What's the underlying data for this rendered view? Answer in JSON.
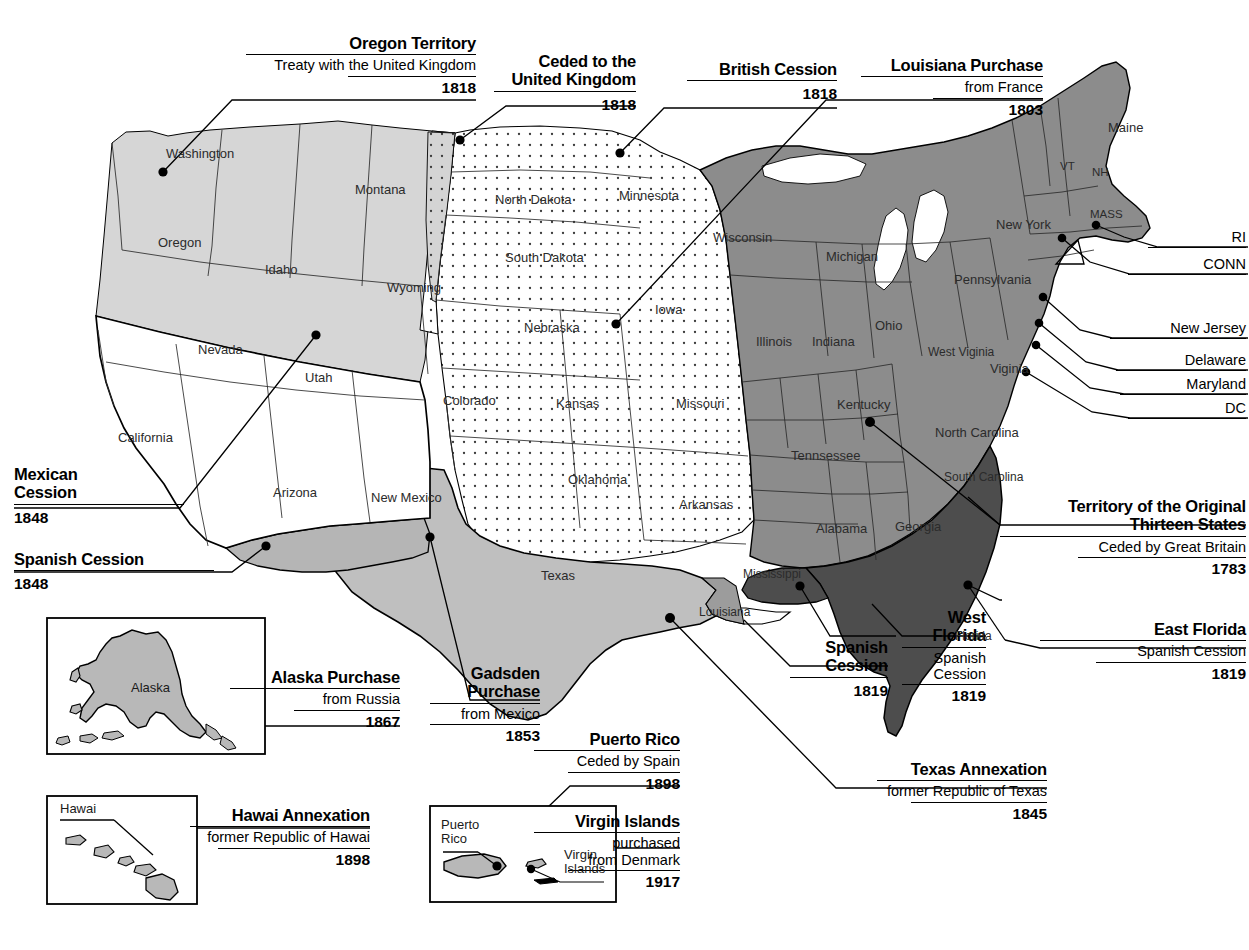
{
  "map": {
    "title": "United States territorial acquisitions",
    "colors": {
      "original_thirteen": "#8c8c8c",
      "florida_cession": "#4d4d4d",
      "oregon_territory": "#d4d4d4",
      "texas_annexation": "#bdbdbd",
      "gadsden_purchase": "#b3b3b3",
      "louisiana_purchase_stipple": "#ffffff",
      "mexican_cession": "#ffffff",
      "outline": "#000000"
    }
  },
  "callouts": [
    {
      "id": "oregon-territory",
      "title": "Oregon Territory",
      "sub": "Treaty with the United Kingdom",
      "year": "1818"
    },
    {
      "id": "ceded-uk",
      "title": "Ceded to the\nUnited Kingdom",
      "sub": "",
      "year": "1818"
    },
    {
      "id": "british-cession",
      "title": "British Cession",
      "sub": "",
      "year": "1818"
    },
    {
      "id": "louisiana-purchase",
      "title": "Louisiana Purchase",
      "sub": "from France",
      "year": "1803"
    },
    {
      "id": "thirteen-states",
      "title": "Territory of the Original\nThirteen States",
      "sub": "Ceded by Great Britain",
      "year": "1783"
    },
    {
      "id": "east-florida",
      "title": "East Florida",
      "sub": "Spanish Cession",
      "year": "1819"
    },
    {
      "id": "west-florida",
      "title": "West\nFlorida",
      "sub": "Spanish\nCession",
      "year": "1819"
    },
    {
      "id": "spanish-cession-gulf",
      "title": "Spanish\nCession",
      "sub": "",
      "year": "1819"
    },
    {
      "id": "mexican-cession",
      "title": "Mexican\nCession",
      "sub": "",
      "year": "1848"
    },
    {
      "id": "spanish-cession-west",
      "title": "Spanish Cession",
      "sub": "",
      "year": "1848"
    },
    {
      "id": "alaska-purchase",
      "title": "Alaska Purchase",
      "sub": "from Russia",
      "year": "1867"
    },
    {
      "id": "gadsden-purchase",
      "title": "Gadsden\nPurchase",
      "sub": "from Mexico",
      "year": "1853"
    },
    {
      "id": "hawai-annexation",
      "title": "Hawai Annexation",
      "sub": "former Republic of Hawai",
      "year": "1898"
    },
    {
      "id": "puerto-rico",
      "title": "Puerto Rico",
      "sub": "Ceded by Spain",
      "year": "1898"
    },
    {
      "id": "virgin-islands",
      "title": "Virgin Islands",
      "sub": "purchased\nfrom Denmark",
      "year": "1917"
    },
    {
      "id": "texas-annexation",
      "title": "Texas Annexation",
      "sub": "former Republic of Texas",
      "year": "1845"
    }
  ],
  "state_labels": [
    "Washington",
    "Oregon",
    "Idaho",
    "Montana",
    "Wyoming",
    "Nevada",
    "Utah",
    "Colorado",
    "California",
    "Arizona",
    "New Mexico",
    "Texas",
    "Oklahoma",
    "Kansas",
    "Nebraska",
    "South Dakota",
    "North Dakota",
    "Minnesota",
    "Iowa",
    "Missouri",
    "Arkansas",
    "Louisiana",
    "Mississippi",
    "Alabama",
    "Georgia",
    "Florida",
    "South Carolina",
    "North Carolina",
    "Tennsessee",
    "Kentucky",
    "West Viginia",
    "Viginia",
    "Ohio",
    "Indiana",
    "Illinois",
    "Michigan",
    "Wisconsin",
    "Pennsylvania",
    "New York",
    "Maine",
    "VT",
    "NH",
    "MASS",
    "RI",
    "CONN",
    "New Jersey",
    "Delaware",
    "Maryland",
    "DC"
  ],
  "states": {
    "washington": "Washington",
    "oregon": "Oregon",
    "idaho": "Idaho",
    "montana": "Montana",
    "wyoming": "Wyoming",
    "nevada": "Nevada",
    "utah": "Utah",
    "colorado": "Colorado",
    "california": "California",
    "arizona": "Arizona",
    "new_mexico": "New Mexico",
    "texas": "Texas",
    "oklahoma": "Oklahoma",
    "kansas": "Kansas",
    "nebraska": "Nebraska",
    "south_dakota": "South Dakota",
    "north_dakota": "North Dakota",
    "minnesota": "Minnesota",
    "iowa": "Iowa",
    "missouri": "Missouri",
    "arkansas": "Arkansas",
    "louisiana": "Louisiana",
    "mississippi": "Mississippi",
    "alabama": "Alabama",
    "georgia": "Georgia",
    "florida": "Florida",
    "south_carolina": "South\nCarolina",
    "north_carolina": "North Carolina",
    "tennessee": "Tennsessee",
    "kentucky": "Kentucky",
    "west_virginia": "West\nViginia",
    "virginia": "Viginia",
    "ohio": "Ohio",
    "indiana": "Indiana",
    "illinois": "Illinois",
    "michigan": "Michigan",
    "wisconsin": "Wisconsin",
    "pennsylvania": "Pennsylvania",
    "new_york": "New York",
    "maine": "Maine",
    "vermont": "VT",
    "new_hampshire": "NH",
    "massachusetts": "MASS",
    "rhode_island": "RI",
    "connecticut": "CONN",
    "new_jersey": "New Jersey",
    "delaware": "Delaware",
    "maryland": "Maryland",
    "dc": "DC"
  },
  "insets": {
    "alaska": {
      "label": "Alaska"
    },
    "hawaii": {
      "label": "Hawai"
    },
    "caribbean": {
      "puerto_rico": "Puerto\nRico",
      "virgin_islands": "Virgin\nIslands"
    }
  }
}
